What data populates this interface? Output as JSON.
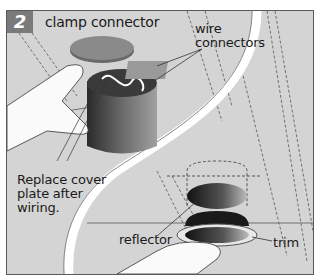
{
  "step": {
    "number": "2"
  },
  "labels": {
    "clamp_connector": "clamp connector",
    "wire_connectors_line1": "wire",
    "wire_connectors_line2": "connectors",
    "replace_line1": "Replace cover",
    "replace_line2": "plate after",
    "replace_line3": "wiring.",
    "reflector": "reflector",
    "trim": "trim"
  },
  "colors": {
    "background": "#d4d4d4",
    "badge": "#7a7a7a",
    "frame": "#5a5a5a",
    "curve": "#ffffff"
  }
}
